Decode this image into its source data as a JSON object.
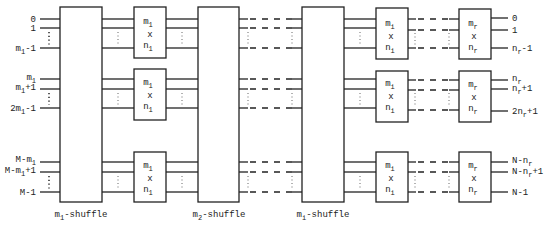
{
  "diagram": {
    "stages": [
      {
        "type": "shuffle",
        "label": "m1-shuffle",
        "label_main": "m",
        "label_sub": "1",
        "label_rest": "-shuffle"
      },
      {
        "type": "switch",
        "label_top": "m",
        "top_sub": "1",
        "cross": "x",
        "label_bottom": "n",
        "bottom_sub": "1"
      },
      {
        "type": "shuffle",
        "label": "m2-shuffle",
        "label_main": "m",
        "label_sub": "2",
        "label_rest": "-shuffle"
      },
      {
        "type": "shuffle",
        "label": "mi-shuffle",
        "label_main": "m",
        "label_sub": "i",
        "label_rest": "-shuffle"
      },
      {
        "type": "switch",
        "label_top": "m",
        "top_sub": "i",
        "cross": "x",
        "label_bottom": "n",
        "bottom_sub": "i"
      },
      {
        "type": "switch",
        "label_top": "m",
        "top_sub": "r",
        "cross": "x",
        "label_bottom": "n",
        "bottom_sub": "r"
      }
    ],
    "inputs": {
      "group1": [
        {
          "main": "0",
          "sub": "",
          "rest": ""
        },
        {
          "main": "1",
          "sub": "",
          "rest": ""
        },
        {
          "main": "m",
          "sub": "1",
          "rest": "-1"
        }
      ],
      "group2": [
        {
          "main": "m",
          "sub": "1",
          "rest": ""
        },
        {
          "main": "m",
          "sub": "1",
          "rest": "+1"
        },
        {
          "main": "2m",
          "sub": "1",
          "rest": "-1"
        }
      ],
      "group3": [
        {
          "main": "M-m",
          "sub": "1",
          "rest": ""
        },
        {
          "main": "M-m",
          "sub": "1",
          "rest": "+1"
        },
        {
          "main": "M-1",
          "sub": "",
          "rest": ""
        }
      ]
    },
    "outputs": {
      "group1": [
        {
          "main": "0",
          "sub": "",
          "rest": ""
        },
        {
          "main": "1",
          "sub": "",
          "rest": ""
        },
        {
          "main": "n",
          "sub": "r",
          "rest": "-1"
        }
      ],
      "group2": [
        {
          "main": "n",
          "sub": "r",
          "rest": ""
        },
        {
          "main": "n",
          "sub": "r",
          "rest": "+1"
        },
        {
          "main": "2n",
          "sub": "r",
          "rest": "+1"
        }
      ],
      "group3": [
        {
          "main": "N-n",
          "sub": "r",
          "rest": ""
        },
        {
          "main": "N-n",
          "sub": "r",
          "rest": "+1"
        },
        {
          "main": "N-1",
          "sub": "",
          "rest": ""
        }
      ]
    },
    "colors": {
      "line": "#222222",
      "background": "#ffffff"
    }
  }
}
